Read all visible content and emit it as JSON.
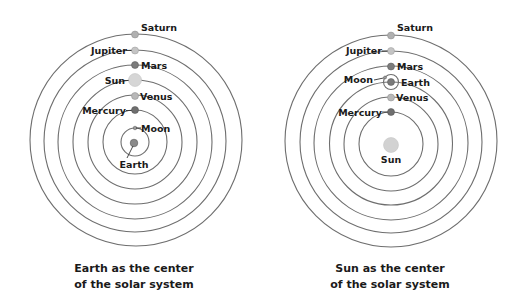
{
  "diagrams": [
    {
      "id": "geocentric",
      "caption": [
        "Earth as the center",
        "of the solar system"
      ],
      "center": {
        "x": 135,
        "y": 142
      },
      "center_body": {
        "name": "Earth",
        "label": "Earth",
        "color": "#8a8a8a"
      },
      "bodies": [
        {
          "name": "Moon",
          "label": "Moon",
          "radius": 14,
          "dot": 2,
          "color": "#9a9a9a",
          "label_side": "right"
        },
        {
          "name": "Mercury",
          "label": "Mercury",
          "radius": 32,
          "dot": 3.5,
          "color": "#6f6f6f",
          "label_side": "left"
        },
        {
          "name": "Venus",
          "label": "Venus",
          "radius": 47,
          "dot": 3.5,
          "color": "#b8b8b8",
          "label_side": "right"
        },
        {
          "name": "Sun",
          "label": "Sun",
          "radius": 62,
          "dot": 6.5,
          "color": "#d6d6d6",
          "label_side": "left"
        },
        {
          "name": "Mars",
          "label": "Mars",
          "radius": 77,
          "dot": 3.5,
          "color": "#7c7c7c",
          "label_side": "right"
        },
        {
          "name": "Jupiter",
          "label": "Jupiter",
          "radius": 91,
          "dot": 3.5,
          "color": "#c4c4c4",
          "label_side": "left"
        },
        {
          "name": "Saturn",
          "label": "Saturn",
          "radius": 106,
          "dot": 3.5,
          "color": "#b0b0b0",
          "label_side": "right-up"
        }
      ]
    },
    {
      "id": "heliocentric",
      "caption": [
        "Sun as the center",
        "of the solar system"
      ],
      "center": {
        "x": 390,
        "y": 143
      },
      "center_body": {
        "name": "Sun",
        "label": "Sun",
        "color": "#d2d2d2"
      },
      "bodies": [
        {
          "name": "Mercury",
          "label": "Mercury",
          "radius": 32,
          "dot": 3.5,
          "color": "#6f6f6f",
          "label_side": "left"
        },
        {
          "name": "Venus",
          "label": "Venus",
          "radius": 46,
          "dot": 3.5,
          "color": "#b8b8b8",
          "label_side": "right"
        },
        {
          "name": "Earth",
          "label": "Earth",
          "radius": 61,
          "dot": 3.5,
          "color": "#7a7a7a",
          "label_side": "right"
        },
        {
          "name": "Mars",
          "label": "Mars",
          "radius": 77,
          "dot": 3.5,
          "color": "#7c7c7c",
          "label_side": "right"
        },
        {
          "name": "Jupiter",
          "label": "Jupiter",
          "radius": 92,
          "dot": 3.5,
          "color": "#c4c4c4",
          "label_side": "left"
        },
        {
          "name": "Saturn",
          "label": "Saturn",
          "radius": 108,
          "dot": 3.5,
          "color": "#b0b0b0",
          "label_side": "right-up"
        }
      ],
      "moon": {
        "name": "Moon",
        "label": "Moon",
        "orbit_radius": 7,
        "label_side": "left"
      }
    }
  ],
  "colors": {
    "orbit": "#6e6e6e",
    "text": "#1a1a1a",
    "background": "#ffffff"
  }
}
